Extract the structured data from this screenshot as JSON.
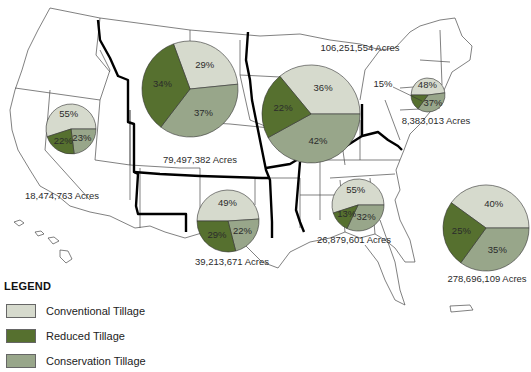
{
  "legend": {
    "title": "LEGEND",
    "items": [
      {
        "label": "Conventional Tillage",
        "color": "#d6dacd"
      },
      {
        "label": "Reduced Tillage",
        "color": "#56702f"
      },
      {
        "label": "Conservation Tillage",
        "color": "#98a68a"
      }
    ]
  },
  "regions": [
    {
      "name": "West",
      "acres_label": "18,474,763 Acres",
      "conventional": 55,
      "reduced": 22,
      "conservation": 23,
      "cx": 71,
      "cy": 129,
      "r": 25,
      "label_x": 62,
      "label_y": 199
    },
    {
      "name": "Northern Plains",
      "acres_label": "79,497,382 Acres",
      "conventional": 29,
      "reduced": 34,
      "conservation": 37,
      "cx": 190,
      "cy": 89,
      "r": 48,
      "label_x": 200,
      "label_y": 163
    },
    {
      "name": "Midwest",
      "acres_label": "106,251,554 Acres",
      "conventional": 36,
      "reduced": 22,
      "conservation": 42,
      "cx": 311,
      "cy": 114,
      "r": 49,
      "label_x": 360,
      "label_y": 51
    },
    {
      "name": "Northeast",
      "acres_label": "8,383,013 Acres",
      "conventional": 48,
      "reduced": 15,
      "conservation": 37,
      "cx": 428,
      "cy": 95,
      "r": 17,
      "label_x": 436,
      "label_y": 124,
      "reduced_outside_label": "15%",
      "reduced_label_x": 383,
      "reduced_label_y": 84
    },
    {
      "name": "Southern Plains",
      "acres_label": "39,213,671 Acres",
      "conventional": 49,
      "reduced": 29,
      "conservation": 22,
      "cx": 228,
      "cy": 221,
      "r": 31,
      "label_x": 232,
      "label_y": 265
    },
    {
      "name": "Delta",
      "acres_label": "26,879,601 Acres",
      "conventional": 55,
      "reduced": 13,
      "conservation": 32,
      "cx": 358,
      "cy": 205,
      "r": 26,
      "label_x": 354,
      "label_y": 243
    },
    {
      "name": "Southeast",
      "acres_label": "278,696,109 Acres",
      "conventional": 40,
      "reduced": 25,
      "conservation": 35,
      "cx": 486,
      "cy": 228,
      "r": 43,
      "label_x": 487,
      "label_y": 282
    }
  ]
}
